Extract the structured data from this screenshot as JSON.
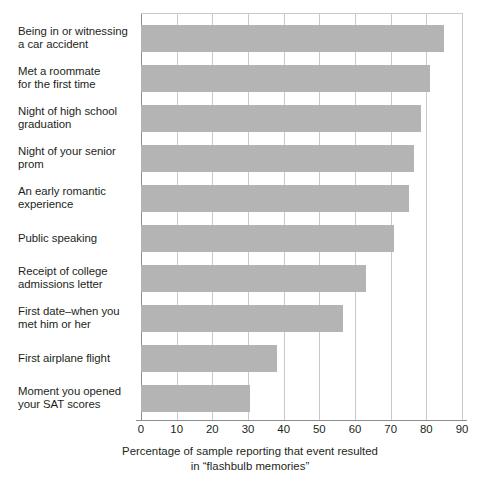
{
  "chart_data": {
    "type": "bar",
    "orientation": "horizontal",
    "title": "",
    "xlabel": "Percentage of sample reporting that event resulted in \"flashbulb memories\"",
    "ylabel": "",
    "xlim": [
      0,
      90
    ],
    "xticks": [
      0,
      10,
      20,
      30,
      40,
      50,
      60,
      70,
      80,
      90
    ],
    "grid": true,
    "legend": null,
    "bar_color": "#b4b4b4",
    "categories": [
      "Being in or witnessing a car accident",
      "Met a roommate for the first time",
      "Night of high school graduation",
      "Night of your senior prom",
      "An early romantic experience",
      "Public speaking",
      "Receipt of college admissions letter",
      "First date–when you met him or her",
      "First airplane flight",
      "Moment you opened your SAT scores"
    ],
    "values": [
      85,
      81,
      78.5,
      76.5,
      75,
      71,
      63,
      56.5,
      38,
      30.5
    ]
  },
  "labels": [
    {
      "line1": "Being in or witnessing",
      "line2": "a car accident"
    },
    {
      "line1": "Met a roommate",
      "line2": "for the first time"
    },
    {
      "line1": "Night of high school",
      "line2": "graduation"
    },
    {
      "line1": "Night of your senior",
      "line2": "prom"
    },
    {
      "line1": "An early romantic",
      "line2": "experience"
    },
    {
      "line1": "Public speaking",
      "line2": ""
    },
    {
      "line1": "Receipt of college",
      "line2": "admissions letter"
    },
    {
      "line1": "First date–when you",
      "line2": "met him or her"
    },
    {
      "line1": "First airplane flight",
      "line2": ""
    },
    {
      "line1": "Moment you opened",
      "line2": "your SAT scores"
    }
  ],
  "xticks": [
    "0",
    "10",
    "20",
    "30",
    "40",
    "50",
    "60",
    "70",
    "80",
    "90"
  ],
  "caption": {
    "line1": "Percentage of sample reporting that event resulted",
    "line2": "in “flashbulb memories”"
  }
}
